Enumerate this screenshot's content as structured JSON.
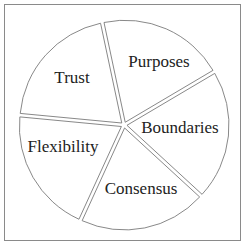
{
  "diagram": {
    "type": "exploded-pie",
    "segments": [
      {
        "label": "Purposes",
        "start_deg": -102,
        "end_deg": -30.6,
        "label_x": 159,
        "label_y": 67
      },
      {
        "label": "Boundaries",
        "start_deg": -30.6,
        "end_deg": 42.6,
        "label_x": 180,
        "label_y": 133
      },
      {
        "label": "Consensus",
        "start_deg": 42.6,
        "end_deg": 114.6,
        "label_x": 141,
        "label_y": 194
      },
      {
        "label": "Flexibility",
        "start_deg": 114.6,
        "end_deg": 185.4,
        "label_x": 63,
        "label_y": 152
      },
      {
        "label": "Trust",
        "start_deg": 185.4,
        "end_deg": 258,
        "label_x": 72,
        "label_y": 83
      }
    ],
    "center": [
      124,
      125
    ],
    "radius": 102,
    "explode_offset": 3,
    "stroke_color": "#7a7a7a",
    "fill_color": "#ffffff",
    "text_color": "#222222",
    "frame_color": "#8a8a8a"
  }
}
